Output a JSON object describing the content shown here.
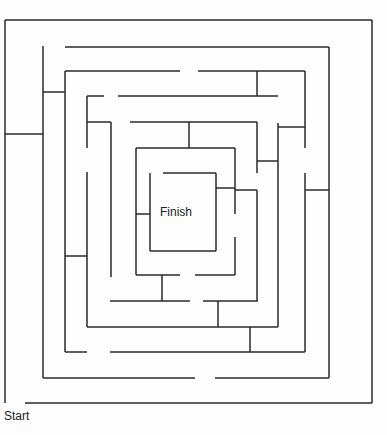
{
  "labels": {
    "start": "Start",
    "finish": "Finish"
  },
  "colors": {
    "wall": "#2a2a2a",
    "background": "#fdfdfd"
  },
  "walls": [
    [
      5,
      20,
      372,
      20
    ],
    [
      372,
      20,
      372,
      403
    ],
    [
      25,
      403,
      372,
      403
    ],
    [
      5,
      20,
      5,
      403
    ],
    [
      5,
      134,
      43,
      134
    ],
    [
      43,
      46,
      43,
      378
    ],
    [
      65,
      47,
      329,
      47
    ],
    [
      329,
      47,
      329,
      378
    ],
    [
      43,
      378,
      195,
      378
    ],
    [
      215,
      378,
      329,
      378
    ],
    [
      43,
      92,
      65,
      92
    ],
    [
      65,
      71,
      65,
      352
    ],
    [
      65,
      71,
      180,
      71
    ],
    [
      198,
      71,
      305,
      71
    ],
    [
      305,
      71,
      305,
      148
    ],
    [
      305,
      173,
      305,
      352
    ],
    [
      65,
      352,
      87,
      352
    ],
    [
      110,
      352,
      305,
      352
    ],
    [
      250,
      327,
      250,
      352
    ],
    [
      305,
      190,
      329,
      190
    ],
    [
      87,
      96,
      104,
      96
    ],
    [
      118,
      96,
      278,
      96
    ],
    [
      257,
      71,
      257,
      96
    ],
    [
      87,
      96,
      87,
      148
    ],
    [
      87,
      172,
      87,
      327
    ],
    [
      87,
      327,
      278,
      327
    ],
    [
      278,
      123,
      278,
      327
    ],
    [
      278,
      127,
      305,
      127
    ],
    [
      218,
      301,
      218,
      327
    ],
    [
      65,
      256,
      87,
      256
    ],
    [
      87,
      122,
      111,
      122
    ],
    [
      111,
      122,
      111,
      277
    ],
    [
      130,
      122,
      257,
      122
    ],
    [
      189,
      122,
      189,
      148
    ],
    [
      257,
      122,
      257,
      173
    ],
    [
      257,
      161,
      278,
      161
    ],
    [
      136,
      148,
      235,
      148
    ],
    [
      136,
      148,
      136,
      275
    ],
    [
      136,
      275,
      180,
      275
    ],
    [
      195,
      275,
      235,
      275
    ],
    [
      235,
      237,
      235,
      275
    ],
    [
      235,
      148,
      235,
      214
    ],
    [
      235,
      190,
      257,
      190
    ],
    [
      257,
      190,
      257,
      301
    ],
    [
      163,
      173,
      216,
      173
    ],
    [
      150,
      173,
      150,
      251
    ],
    [
      150,
      251,
      216,
      251
    ],
    [
      216,
      173,
      216,
      251
    ],
    [
      216,
      188,
      235,
      188
    ],
    [
      136,
      214,
      150,
      214
    ],
    [
      162,
      275,
      162,
      301
    ],
    [
      110,
      301,
      190,
      301
    ],
    [
      203,
      301,
      258,
      301
    ]
  ]
}
